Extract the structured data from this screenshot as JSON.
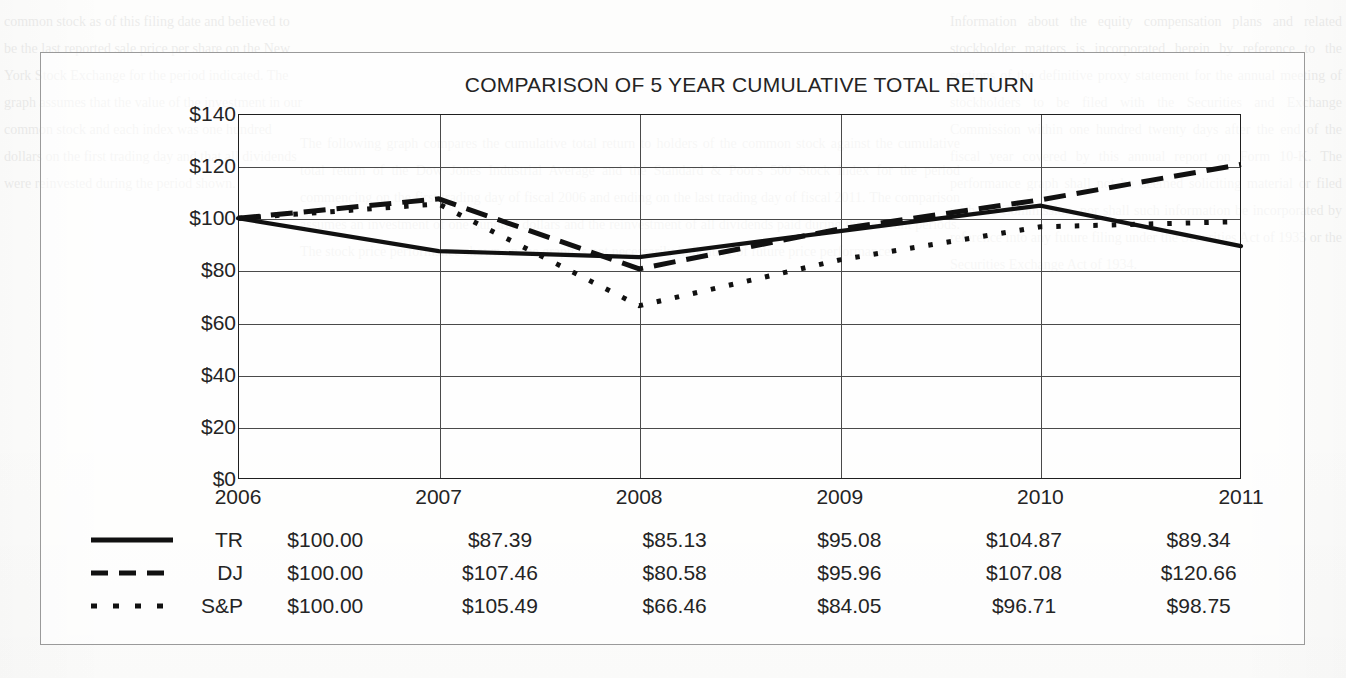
{
  "chart_data": {
    "type": "line",
    "title": "COMPARISON OF 5 YEAR CUMULATIVE TOTAL RETURN",
    "xlabel": "",
    "ylabel": "",
    "categories": [
      "2006",
      "2007",
      "2008",
      "2009",
      "2010",
      "2011"
    ],
    "ylim": [
      0,
      140
    ],
    "ytick_values": [
      0,
      20,
      40,
      60,
      80,
      100,
      120,
      140
    ],
    "ytick_labels": [
      "$0",
      "$20",
      "$40",
      "$60",
      "$80",
      "$100",
      "$120",
      "$140"
    ],
    "grid": true,
    "legend_position": "below-axes-table",
    "series": [
      {
        "name": "TR",
        "style": "solid",
        "swatch": "line-solid-icon",
        "values": [
          100.0,
          87.39,
          85.13,
          95.08,
          104.87,
          89.34
        ],
        "labels": [
          "$100.00",
          "$87.39",
          "$85.13",
          "$95.08",
          "$104.87",
          "$89.34"
        ]
      },
      {
        "name": "DJ",
        "style": "dashed",
        "swatch": "line-dashed-icon",
        "values": [
          100.0,
          107.46,
          80.58,
          95.96,
          107.08,
          120.66
        ],
        "labels": [
          "$100.00",
          "$107.46",
          "$80.58",
          "$95.96",
          "$107.08",
          "$120.66"
        ]
      },
      {
        "name": "S&P",
        "style": "dotted",
        "swatch": "line-dotted-icon",
        "values": [
          100.0,
          105.49,
          66.46,
          84.05,
          96.71,
          98.75
        ],
        "labels": [
          "$100.00",
          "$105.49",
          "$66.46",
          "$84.05",
          "$96.71",
          "$98.75"
        ]
      }
    ],
    "colors": {
      "series_line": "#111111",
      "axis": "#1f1f1f",
      "gridline": "#4a4a4a",
      "frame": "#9a9a9a",
      "background": "#ffffff"
    }
  },
  "bleed_text": {
    "left": "common stock as of this filing date and believed to be the last reported sale price per share on the New York Stock Exchange for the period indicated. The graph assumes that the value of the investment in our common stock and each index was one hundred dollars on the first trading day and that all dividends were reinvested during the period shown.",
    "middle": "The following graph compares the cumulative total return to holders of the common stock against the cumulative total return of the Dow Jones Industrial Average and the Standard & Poor's 500 Stock Index for the period commencing on the first trading day of fiscal 2006 and ending on the last trading day of fiscal 2011. The comparison assumes an investment of one hundred dollars and the reinvestment of all dividends paid during the relevant periods. The stock price performance shown on the graph is not necessarily indicative of future price performance.",
    "right": "Information about the equity compensation plans and related stockholder matters is incorporated herein by reference to the sections of the definitive proxy statement for the annual meeting of stockholders to be filed with the Securities and Exchange Commission within one hundred twenty days after the end of the fiscal year covered by this annual report on Form 10-K. The performance graph shall not be deemed soliciting material or filed with the Commission, nor shall such information be incorporated by reference into any future filing under the Securities Act of 1933 or the Securities Exchange Act of 1934."
  }
}
